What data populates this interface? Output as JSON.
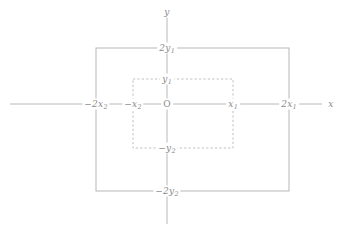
{
  "figure": {
    "type": "coordinate-diagram",
    "colors": {
      "line": "#b0b0b0",
      "dashed": "#b8b8b8",
      "text": "#8a8a8a",
      "background": "#ffffff"
    },
    "axes": {
      "x_label": "x",
      "y_label": "y",
      "origin_label": "O"
    },
    "labels": {
      "outer_top": "2y",
      "outer_top_sub": "1",
      "outer_bottom": "−2y",
      "outer_bottom_sub": "2",
      "outer_left": "−2x",
      "outer_left_sub": "2",
      "outer_right": "2x",
      "outer_right_sub": "1",
      "inner_top": "y",
      "inner_top_sub": "1",
      "inner_bottom": "−y",
      "inner_bottom_sub": "2",
      "inner_left": "−x",
      "inner_left_sub": "2",
      "inner_right": "x",
      "inner_right_sub": "1"
    },
    "geometry": {
      "origin_x": 167,
      "origin_y": 104,
      "outer_rect": {
        "left": 96,
        "top": 48,
        "right": 289,
        "bottom": 191
      },
      "inner_rect": {
        "left": 133,
        "top": 79,
        "right": 233,
        "bottom": 148
      },
      "x_axis": {
        "start": 10,
        "end": 322
      },
      "y_axis": {
        "start": 14,
        "end": 224
      }
    }
  }
}
